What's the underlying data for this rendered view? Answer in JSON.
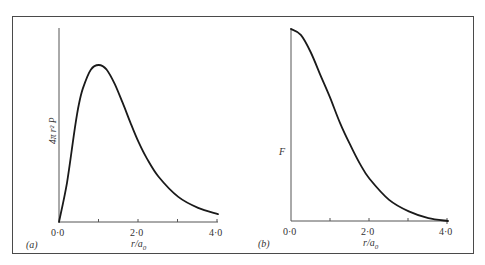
{
  "figure": {
    "frame": {
      "x": 12,
      "y": 16,
      "w": 462,
      "h": 238,
      "stroke": "#4a4a4a"
    },
    "curve_color": "#1a1a1a",
    "axis_color": "#555555"
  },
  "panels": [
    {
      "id": "a",
      "panel_label": "(a)",
      "ylabel": "4π r² P",
      "xlabel_main": "r/a",
      "xlabel_sub": "0",
      "tick_labels": [
        "0·0",
        "2·0",
        "4·0"
      ],
      "origin": {
        "x": 59,
        "y": 222
      },
      "x_end": 218,
      "y_top": 28
    },
    {
      "id": "b",
      "panel_label": "(b)",
      "ylabel": "F",
      "xlabel_main": "r/a",
      "xlabel_sub": "0",
      "tick_labels": [
        "0·0",
        "2·0",
        "4·0"
      ],
      "origin": {
        "x": 291,
        "y": 221
      },
      "x_end": 448,
      "y_top": 28
    }
  ],
  "chart_data": [
    {
      "type": "line",
      "title": "(a)",
      "xlabel": "r/a0",
      "ylabel": "4π r² P",
      "xlim": [
        0,
        4
      ],
      "ylim": [
        0,
        1.2
      ],
      "xticks": [
        0,
        1,
        2,
        3,
        4
      ],
      "xtick_labels": [
        "0·0",
        "",
        "2·0",
        "",
        "4·0"
      ],
      "grid": false,
      "x": [
        0,
        0.2,
        0.4,
        0.5,
        0.6,
        0.8,
        1.0,
        1.2,
        1.4,
        1.6,
        1.8,
        2.0,
        2.2,
        2.5,
        3.0,
        3.5,
        4.0
      ],
      "values": [
        0,
        0.25,
        0.6,
        0.75,
        0.85,
        0.97,
        1.0,
        0.97,
        0.88,
        0.76,
        0.63,
        0.51,
        0.41,
        0.29,
        0.16,
        0.09,
        0.05
      ]
    },
    {
      "type": "line",
      "title": "(b)",
      "xlabel": "r/a0",
      "ylabel": "F",
      "xlim": [
        0,
        4
      ],
      "ylim": [
        0,
        1.0
      ],
      "xticks": [
        0,
        1,
        2,
        3,
        4
      ],
      "xtick_labels": [
        "0·0",
        "",
        "2·0",
        "",
        "4·0"
      ],
      "grid": false,
      "x": [
        0,
        0.25,
        0.5,
        0.75,
        1.0,
        1.25,
        1.5,
        1.75,
        2.0,
        2.5,
        3.0,
        3.5,
        4.0
      ],
      "values": [
        1.0,
        0.97,
        0.88,
        0.76,
        0.64,
        0.51,
        0.4,
        0.3,
        0.22,
        0.11,
        0.05,
        0.015,
        0.0
      ]
    }
  ]
}
